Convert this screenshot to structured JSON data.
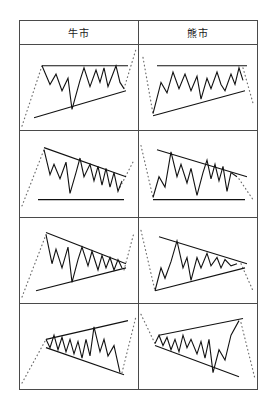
{
  "figure": {
    "title_bull": "牛市",
    "title_bear": "熊市",
    "columns": [
      "牛市",
      "熊市"
    ],
    "line_colors": {
      "price": "#111111",
      "trendline": "#111111",
      "approach_dotted": "#6e6e6e",
      "table_border": "#4a4a4a",
      "background": "#ffffff"
    }
  },
  "chart_data": [
    {
      "type": "line",
      "title": "牛市",
      "pattern": "ascending-triangle",
      "market": "bull",
      "row": 1,
      "xlabel": "",
      "ylabel": "",
      "grid": false,
      "legend": "none",
      "xlim": [
        0,
        118
      ],
      "ylim": [
        0,
        82
      ],
      "approach_entry": [
        2,
        78,
        22,
        20
      ],
      "approach_exit": [
        104,
        42,
        116,
        4
      ],
      "trendlines": [
        {
          "name": "resistance-flat-top",
          "points": [
            22,
            20,
            108,
            20
          ]
        },
        {
          "name": "support-rising",
          "points": [
            14,
            70,
            106,
            44
          ]
        }
      ],
      "series": [
        {
          "name": "price",
          "points": [
            22,
            20,
            30,
            38,
            36,
            28,
            42,
            44,
            48,
            32,
            52,
            62,
            60,
            34,
            64,
            22,
            70,
            40,
            76,
            24,
            80,
            36,
            84,
            22,
            88,
            40,
            92,
            30,
            96,
            20,
            100,
            36,
            104,
            42
          ]
        }
      ]
    },
    {
      "type": "line",
      "title": "熊市",
      "pattern": "ascending-triangle",
      "market": "bear",
      "row": 1,
      "xlabel": "",
      "ylabel": "",
      "grid": false,
      "legend": "none",
      "xlim": [
        0,
        118
      ],
      "ylim": [
        0,
        82
      ],
      "approach_entry": [
        4,
        12,
        14,
        66
      ],
      "approach_exit": [
        104,
        22,
        114,
        56
      ],
      "trendlines": [
        {
          "name": "resistance-flat-top",
          "points": [
            18,
            20,
            108,
            20
          ]
        },
        {
          "name": "support-rising",
          "points": [
            14,
            68,
            106,
            44
          ]
        }
      ],
      "series": [
        {
          "name": "price",
          "points": [
            14,
            66,
            22,
            36,
            28,
            46,
            34,
            26,
            40,
            42,
            46,
            28,
            52,
            44,
            58,
            30,
            62,
            52,
            68,
            32,
            72,
            42,
            78,
            26,
            82,
            38,
            86,
            44,
            92,
            28,
            96,
            38,
            100,
            22,
            104,
            34
          ]
        }
      ]
    },
    {
      "type": "line",
      "title": "牛市",
      "pattern": "descending-triangle",
      "market": "bull",
      "row": 2,
      "xlabel": "",
      "ylabel": "",
      "grid": false,
      "legend": "none",
      "xlim": [
        0,
        118
      ],
      "ylim": [
        0,
        82
      ],
      "approach_entry": [
        2,
        72,
        24,
        18
      ],
      "approach_exit": [
        100,
        54,
        114,
        28
      ],
      "trendlines": [
        {
          "name": "resistance-falling",
          "points": [
            24,
            16,
            106,
            44
          ]
        },
        {
          "name": "support-flat-bottom",
          "points": [
            18,
            66,
            104,
            66
          ]
        }
      ],
      "series": [
        {
          "name": "price",
          "points": [
            24,
            18,
            30,
            42,
            34,
            32,
            40,
            46,
            46,
            30,
            50,
            60,
            56,
            40,
            60,
            26,
            64,
            44,
            70,
            32,
            74,
            48,
            78,
            34,
            82,
            52,
            86,
            36,
            90,
            54,
            94,
            40,
            98,
            58,
            102,
            48
          ]
        }
      ]
    },
    {
      "type": "line",
      "title": "熊市",
      "pattern": "descending-triangle",
      "market": "bear",
      "row": 2,
      "xlabel": "",
      "ylabel": "",
      "grid": false,
      "legend": "none",
      "xlim": [
        0,
        118
      ],
      "ylim": [
        0,
        82
      ],
      "approach_entry": [
        2,
        14,
        14,
        64
      ],
      "approach_exit": [
        100,
        46,
        114,
        66
      ],
      "trendlines": [
        {
          "name": "resistance-falling",
          "points": [
            18,
            18,
            108,
            44
          ]
        },
        {
          "name": "support-flat-bottom",
          "points": [
            14,
            66,
            106,
            66
          ]
        }
      ],
      "series": [
        {
          "name": "price",
          "points": [
            14,
            64,
            20,
            44,
            26,
            54,
            32,
            20,
            38,
            44,
            42,
            32,
            48,
            50,
            52,
            36,
            58,
            62,
            64,
            40,
            68,
            28,
            72,
            46,
            76,
            32,
            80,
            48,
            84,
            34,
            88,
            58,
            92,
            40,
            98,
            44
          ]
        }
      ]
    },
    {
      "type": "line",
      "title": "牛市",
      "pattern": "symmetrical-triangle",
      "market": "bull",
      "row": 3,
      "xlabel": "",
      "ylabel": "",
      "grid": false,
      "legend": "none",
      "xlim": [
        0,
        118
      ],
      "ylim": [
        0,
        82
      ],
      "approach_entry": [
        2,
        76,
        26,
        16
      ],
      "approach_exit": [
        104,
        50,
        114,
        14
      ],
      "trendlines": [
        {
          "name": "resistance-falling",
          "points": [
            26,
            14,
            106,
            44
          ]
        },
        {
          "name": "support-rising",
          "points": [
            16,
            70,
            106,
            48
          ]
        }
      ],
      "series": [
        {
          "name": "price",
          "points": [
            26,
            16,
            32,
            44,
            36,
            30,
            42,
            48,
            48,
            28,
            52,
            62,
            58,
            40,
            62,
            28,
            68,
            46,
            72,
            32,
            78,
            50,
            82,
            36,
            86,
            48,
            90,
            38,
            94,
            50,
            98,
            40,
            102,
            48
          ]
        }
      ]
    },
    {
      "type": "line",
      "title": "熊市",
      "pattern": "symmetrical-triangle",
      "market": "bear",
      "row": 3,
      "xlabel": "",
      "ylabel": "",
      "grid": false,
      "legend": "none",
      "xlim": [
        0,
        118
      ],
      "ylim": [
        0,
        82
      ],
      "approach_entry": [
        2,
        12,
        16,
        70
      ],
      "approach_exit": [
        102,
        44,
        114,
        70
      ],
      "trendlines": [
        {
          "name": "resistance-falling",
          "points": [
            20,
            18,
            108,
            44
          ]
        },
        {
          "name": "support-rising",
          "points": [
            16,
            70,
            106,
            48
          ]
        }
      ],
      "series": [
        {
          "name": "price",
          "points": [
            16,
            70,
            22,
            48,
            26,
            58,
            32,
            42,
            38,
            22,
            44,
            48,
            48,
            38,
            52,
            60,
            58,
            38,
            62,
            48,
            68,
            34,
            72,
            46,
            78,
            38,
            82,
            48,
            86,
            40,
            92,
            46,
            98,
            44
          ]
        }
      ]
    },
    {
      "type": "line",
      "title": "牛市",
      "pattern": "broadening-formation",
      "market": "bull",
      "row": 4,
      "xlabel": "",
      "ylabel": "",
      "grid": false,
      "legend": "none",
      "xlim": [
        0,
        118
      ],
      "ylim": [
        0,
        82
      ],
      "approach_entry": [
        2,
        76,
        26,
        34
      ],
      "approach_exit": [
        102,
        66,
        116,
        12
      ],
      "trendlines": [
        {
          "name": "resistance-rising",
          "points": [
            26,
            34,
            108,
            16
          ]
        },
        {
          "name": "support-falling",
          "points": [
            26,
            42,
            104,
            68
          ]
        }
      ],
      "series": [
        {
          "name": "price",
          "points": [
            26,
            34,
            30,
            42,
            34,
            30,
            38,
            44,
            42,
            32,
            46,
            46,
            50,
            34,
            54,
            48,
            58,
            36,
            62,
            52,
            66,
            34,
            70,
            50,
            74,
            22,
            80,
            46,
            84,
            34,
            88,
            50,
            94,
            40,
            100,
            66
          ]
        }
      ]
    },
    {
      "type": "line",
      "title": "熊市",
      "pattern": "broadening-formation",
      "market": "bear",
      "row": 4,
      "xlabel": "",
      "ylabel": "",
      "grid": false,
      "legend": "none",
      "xlim": [
        0,
        118
      ],
      "ylim": [
        0,
        82
      ],
      "approach_entry": [
        2,
        10,
        16,
        38
      ],
      "approach_exit": [
        102,
        18,
        116,
        72
      ],
      "trendlines": [
        {
          "name": "resistance-rising",
          "points": [
            20,
            30,
            104,
            14
          ]
        },
        {
          "name": "support-falling",
          "points": [
            16,
            40,
            100,
            70
          ]
        }
      ],
      "series": [
        {
          "name": "price",
          "points": [
            16,
            38,
            20,
            30,
            24,
            40,
            28,
            32,
            32,
            44,
            36,
            34,
            40,
            46,
            44,
            30,
            48,
            42,
            52,
            34,
            58,
            48,
            62,
            36,
            66,
            52,
            70,
            34,
            74,
            66,
            80,
            44,
            86,
            54,
            92,
            30,
            100,
            16
          ]
        }
      ]
    }
  ]
}
